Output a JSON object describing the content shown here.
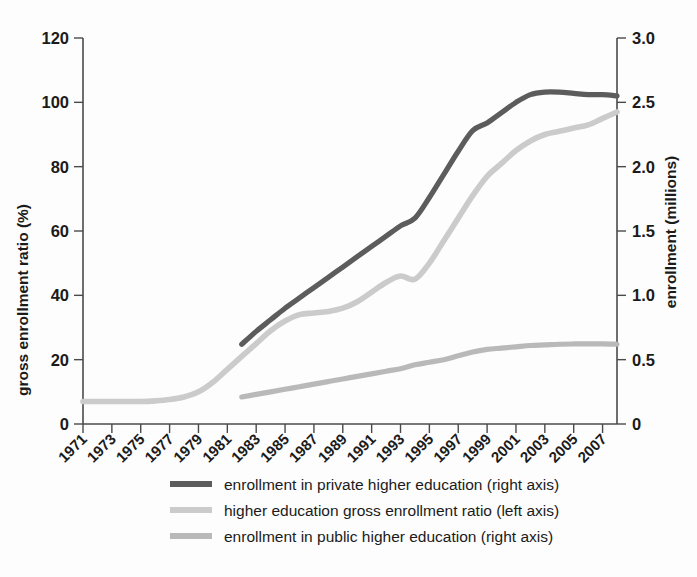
{
  "chart_data": {
    "type": "line",
    "title": "",
    "xlabel": "",
    "ylabel": "gross enrollment ratio (%)",
    "y2label": "enrollment (millions)",
    "xlim": [
      1971,
      2008
    ],
    "ylim": [
      0,
      120
    ],
    "y2lim": [
      0,
      3.0
    ],
    "grid": false,
    "legend_position": "bottom",
    "x_tick_labels": [
      "1971",
      "1973",
      "1975",
      "1977",
      "1979",
      "1981",
      "1983",
      "1985",
      "1987",
      "1989",
      "1991",
      "1993",
      "1995",
      "1997",
      "1999",
      "2001",
      "2003",
      "2005",
      "2007"
    ],
    "y_tick_labels": [
      "0",
      "20",
      "40",
      "60",
      "80",
      "100",
      "120"
    ],
    "y_tick_values": [
      0,
      20,
      40,
      60,
      80,
      100,
      120
    ],
    "y2_tick_labels": [
      "0",
      "0.5",
      "1.0",
      "1.5",
      "2.0",
      "2.5",
      "3.0"
    ],
    "y2_tick_values": [
      0,
      0.5,
      1.0,
      1.5,
      2.0,
      2.5,
      3.0
    ],
    "x": [
      1971,
      1972,
      1973,
      1974,
      1975,
      1976,
      1977,
      1978,
      1979,
      1980,
      1981,
      1982,
      1983,
      1984,
      1985,
      1986,
      1987,
      1988,
      1989,
      1990,
      1991,
      1992,
      1993,
      1994,
      1995,
      1996,
      1997,
      1998,
      1999,
      2000,
      2001,
      2002,
      2003,
      2004,
      2005,
      2006,
      2007,
      2008
    ],
    "series": [
      {
        "name": "enrollment in private higher education (right axis)",
        "axis": "right",
        "unit": "millions",
        "color": "#5c5c5c",
        "stroke_width": 5.2,
        "x": [
          1982,
          1983,
          1984,
          1985,
          1986,
          1987,
          1988,
          1989,
          1990,
          1991,
          1992,
          1993,
          1994,
          1995,
          1996,
          1997,
          1998,
          1999,
          2000,
          2001,
          2002,
          2003,
          2004,
          2005,
          2006,
          2007,
          2008
        ],
        "values": [
          0.62,
          0.72,
          0.81,
          0.9,
          0.98,
          1.06,
          1.14,
          1.22,
          1.3,
          1.38,
          1.46,
          1.54,
          1.6,
          1.76,
          1.94,
          2.12,
          2.28,
          2.34,
          2.42,
          2.5,
          2.56,
          2.58,
          2.58,
          2.57,
          2.56,
          2.56,
          2.55
        ]
      },
      {
        "name": "higher education gross enrollment ratio (left axis)",
        "axis": "left",
        "unit": "percent",
        "color": "#cbcbcb",
        "stroke_width": 5.6,
        "x": [
          1971,
          1972,
          1973,
          1974,
          1975,
          1976,
          1977,
          1978,
          1979,
          1980,
          1981,
          1982,
          1983,
          1984,
          1985,
          1986,
          1987,
          1988,
          1989,
          1990,
          1991,
          1992,
          1993,
          1994,
          1995,
          1996,
          1997,
          1998,
          1999,
          2000,
          2001,
          2002,
          2003,
          2004,
          2005,
          2006,
          2007,
          2008
        ],
        "values": [
          7,
          7,
          7,
          7,
          7,
          7.2,
          7.6,
          8.4,
          10,
          13,
          17,
          21,
          25,
          29,
          32,
          34,
          34.5,
          35,
          36,
          38,
          41,
          44,
          46,
          45,
          50,
          57,
          64,
          71,
          77,
          81,
          85,
          88,
          90,
          91,
          92,
          93,
          95,
          97
        ]
      },
      {
        "name": "enrollment in public higher education (right axis)",
        "axis": "right",
        "unit": "millions",
        "color": "#b9b9b9",
        "stroke_width": 5.2,
        "x": [
          1982,
          1983,
          1984,
          1985,
          1986,
          1987,
          1988,
          1989,
          1990,
          1991,
          1992,
          1993,
          1994,
          1995,
          1996,
          1997,
          1998,
          1999,
          2000,
          2001,
          2002,
          2003,
          2004,
          2005,
          2006,
          2007,
          2008
        ],
        "values": [
          0.21,
          0.23,
          0.25,
          0.27,
          0.29,
          0.31,
          0.33,
          0.35,
          0.37,
          0.39,
          0.41,
          0.43,
          0.46,
          0.48,
          0.5,
          0.53,
          0.56,
          0.58,
          0.59,
          0.6,
          0.61,
          0.615,
          0.62,
          0.622,
          0.623,
          0.623,
          0.62
        ]
      }
    ]
  },
  "legend": {
    "items": [
      {
        "label": "enrollment in private higher education (right axis)",
        "color": "#5c5c5c"
      },
      {
        "label": "higher education gross enrollment ratio (left axis)",
        "color": "#cbcbcb"
      },
      {
        "label": "enrollment in public higher education (right axis)",
        "color": "#b9b9b9"
      }
    ]
  },
  "axes": {
    "left_title": "gross enrollment ratio (%)",
    "right_title": "enrollment (millions)"
  }
}
